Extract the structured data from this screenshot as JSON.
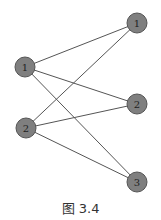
{
  "figure": {
    "caption": "图 3.4",
    "type": "bipartite-graph",
    "node_color": "#7f7f7f",
    "edge_color": "#555555",
    "nodes": [
      {
        "id": "L1",
        "label": "1",
        "x": 25,
        "y": 67
      },
      {
        "id": "L2",
        "label": "2",
        "x": 26,
        "y": 128
      },
      {
        "id": "R1",
        "label": "1",
        "x": 137,
        "y": 23
      },
      {
        "id": "R2",
        "label": "2",
        "x": 137,
        "y": 104
      },
      {
        "id": "R3",
        "label": "3",
        "x": 137,
        "y": 182
      }
    ],
    "edges": [
      [
        "L1",
        "R1"
      ],
      [
        "L1",
        "R2"
      ],
      [
        "L1",
        "R3"
      ],
      [
        "L2",
        "R1"
      ],
      [
        "L2",
        "R2"
      ],
      [
        "L2",
        "R3"
      ]
    ]
  }
}
